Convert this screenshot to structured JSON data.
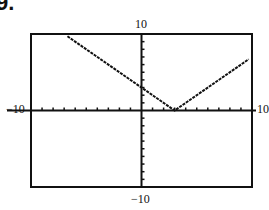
{
  "problem_number": "9.",
  "labels": {
    "ymax": "10",
    "ymin": "−10",
    "xmin": "−10",
    "xmax": "10"
  },
  "chart_data": {
    "type": "line",
    "title": "",
    "function": "y = |x - 3|",
    "xlim": [
      -10,
      10
    ],
    "ylim": [
      -10,
      10
    ],
    "xscale": 1,
    "yscale": 1,
    "grid": false,
    "series": [
      {
        "name": "y = |x - 3|",
        "x": [
          -6.7,
          3,
          9.7
        ],
        "y": [
          9.7,
          0,
          6.7
        ]
      }
    ],
    "tick_labels": {
      "xmin": "-10",
      "xmax": "10",
      "ymin": "-10",
      "ymax": "10"
    }
  }
}
